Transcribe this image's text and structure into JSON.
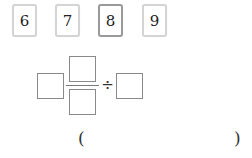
{
  "cards": [
    {
      "label": "6",
      "selected": false
    },
    {
      "label": "7",
      "selected": false
    },
    {
      "label": "8",
      "selected": true
    },
    {
      "label": "9",
      "selected": false
    }
  ],
  "expression": {
    "operator": "÷",
    "boxes": [
      "left-operand",
      "numerator",
      "denominator",
      "right-operand"
    ]
  },
  "answer": {
    "open_paren": "(",
    "value": "",
    "close_paren": ")"
  }
}
